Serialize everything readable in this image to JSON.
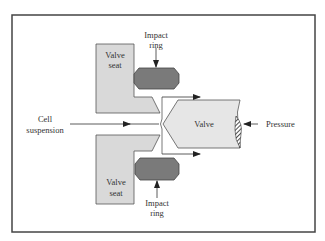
{
  "diagram": {
    "type": "high-pressure homogenizer valve cross-section",
    "colors": {
      "frame": "#444444",
      "seat_fill": "#d9d9d9",
      "ring_fill": "#7a7a7a",
      "valve_fill": "#e6e6e6",
      "line": "#333333",
      "text": "#333333"
    },
    "labels": {
      "top_seat_line1": "Valve",
      "top_seat_line2": "seat",
      "bottom_seat_line1": "Valve",
      "bottom_seat_line2": "seat",
      "top_ring_line1": "Impact",
      "top_ring_line2": "ring",
      "bottom_ring_line1": "Impact",
      "bottom_ring_line2": "ring",
      "inlet_line1": "Cell",
      "inlet_line2": "suspension",
      "valve": "Valve",
      "pressure": "Pressure"
    },
    "components": [
      {
        "name": "valve-seat-top",
        "label": "Valve seat"
      },
      {
        "name": "valve-seat-bottom",
        "label": "Valve seat"
      },
      {
        "name": "impact-ring-top",
        "label": "Impact ring"
      },
      {
        "name": "impact-ring-bottom",
        "label": "Impact ring"
      },
      {
        "name": "valve",
        "label": "Valve"
      }
    ],
    "flows": [
      {
        "from": "Cell suspension",
        "to": "valve gap",
        "direction": "right"
      },
      {
        "from": "valve gap",
        "to": "outlet-top",
        "direction": "right"
      },
      {
        "from": "valve gap",
        "to": "outlet-bottom",
        "direction": "right"
      },
      {
        "from": "Pressure",
        "to": "valve",
        "direction": "left"
      }
    ]
  }
}
